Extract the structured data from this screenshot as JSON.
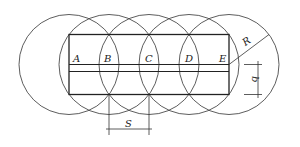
{
  "diagram": {
    "type": "overlapping-circles-strip",
    "colors": {
      "stroke": "#333333",
      "background": "#ffffff"
    },
    "circles": {
      "centers_x": [
        69,
        109,
        149,
        189,
        229
      ],
      "center_y": 64.5,
      "radius": 50
    },
    "points": [
      {
        "label": "A",
        "x": 73,
        "y": 62
      },
      {
        "label": "B",
        "x": 104,
        "y": 62
      },
      {
        "label": "C",
        "x": 145,
        "y": 62
      },
      {
        "label": "D",
        "x": 185,
        "y": 62
      },
      {
        "label": "E",
        "x": 219,
        "y": 62
      }
    ],
    "dimensions": {
      "spacing_label": "S",
      "radius_label": "R",
      "width_label": "b"
    }
  }
}
